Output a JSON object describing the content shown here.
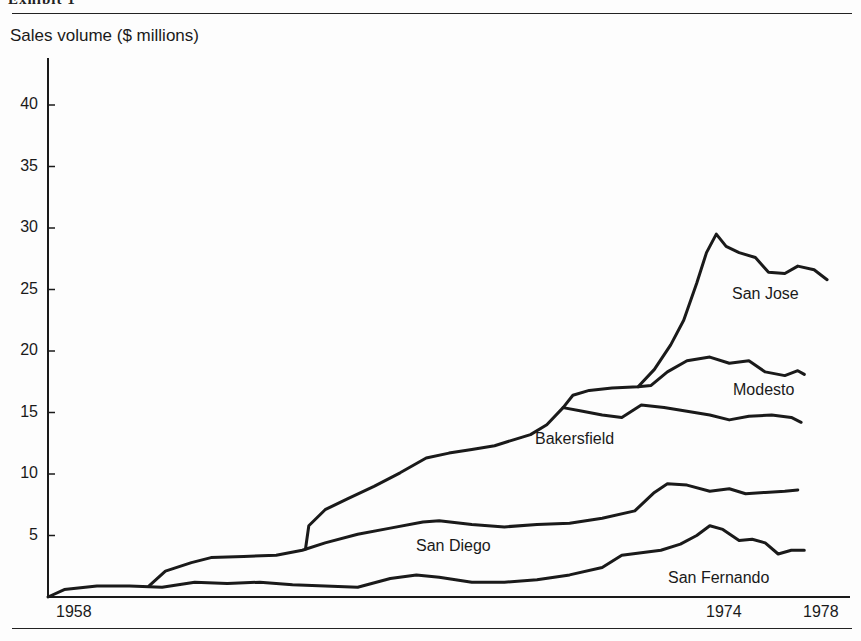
{
  "header": {
    "exhibit_label": "Exhibit 1"
  },
  "chart_data": {
    "type": "line",
    "title": "",
    "ylabel": "Sales volume ($ millions)",
    "xlabel": "",
    "ylim": [
      0,
      43
    ],
    "xlim": [
      1958,
      1978
    ],
    "y_ticks": [
      {
        "value": 40,
        "label": "40"
      },
      {
        "value": 35,
        "label": "35"
      },
      {
        "value": 30,
        "label": "30"
      },
      {
        "value": 25,
        "label": "25"
      },
      {
        "value": 20,
        "label": "20"
      },
      {
        "value": 15,
        "label": "15"
      },
      {
        "value": 10,
        "label": "10"
      },
      {
        "value": 5,
        "label": "5"
      }
    ],
    "x_ticks": [
      {
        "label": "1958",
        "px": 56
      },
      {
        "label": "1974",
        "px": 706
      },
      {
        "label": "1978",
        "px": 803
      }
    ],
    "grid": false,
    "legend": "inline labels",
    "series": [
      {
        "name": "San Fernando",
        "label_px": [
          668,
          569
        ],
        "points": [
          [
            1958,
            0
          ],
          [
            1958.5,
            0.6
          ],
          [
            1959.5,
            0.9
          ],
          [
            1960.5,
            0.9
          ],
          [
            1961.5,
            0.8
          ],
          [
            1962.5,
            1.2
          ],
          [
            1963.5,
            1.1
          ],
          [
            1964.5,
            1.2
          ],
          [
            1965.5,
            1.0
          ],
          [
            1966.5,
            0.9
          ],
          [
            1967.5,
            0.8
          ],
          [
            1968.5,
            1.5
          ],
          [
            1969.3,
            1.8
          ],
          [
            1970,
            1.6
          ],
          [
            1971,
            1.2
          ],
          [
            1972,
            1.2
          ],
          [
            1973,
            1.4
          ],
          [
            1974,
            1.8
          ],
          [
            1975,
            2.4
          ],
          [
            1975.6,
            3.4
          ],
          [
            1976.2,
            3.6
          ],
          [
            1976.8,
            3.8
          ],
          [
            1977.4,
            4.3
          ],
          [
            1977.9,
            5.0
          ],
          [
            1978.3,
            5.8
          ],
          [
            1978.7,
            5.5
          ],
          [
            1979.2,
            4.6
          ],
          [
            1979.6,
            4.7
          ],
          [
            1980,
            4.4
          ],
          [
            1980.4,
            3.5
          ],
          [
            1980.8,
            3.8
          ],
          [
            1981.2,
            3.8
          ]
        ]
      },
      {
        "name": "San Diego",
        "label_px": [
          416,
          537
        ],
        "points": [
          [
            1961.1,
            0.9
          ],
          [
            1961.6,
            2.1
          ],
          [
            1962.4,
            2.8
          ],
          [
            1963,
            3.2
          ],
          [
            1964,
            3.3
          ],
          [
            1965,
            3.4
          ],
          [
            1965.8,
            3.8
          ],
          [
            1966.5,
            4.4
          ],
          [
            1967.5,
            5.1
          ],
          [
            1968.5,
            5.6
          ],
          [
            1969.5,
            6.1
          ],
          [
            1970,
            6.2
          ],
          [
            1971,
            5.9
          ],
          [
            1972,
            5.7
          ],
          [
            1973,
            5.9
          ],
          [
            1974,
            6.0
          ],
          [
            1975,
            6.4
          ],
          [
            1976,
            7.0
          ],
          [
            1976.6,
            8.5
          ],
          [
            1977,
            9.2
          ],
          [
            1977.6,
            9.1
          ],
          [
            1978.3,
            8.6
          ],
          [
            1978.9,
            8.8
          ],
          [
            1979.4,
            8.4
          ],
          [
            1980,
            8.5
          ],
          [
            1980.6,
            8.6
          ],
          [
            1981,
            8.7
          ]
        ]
      },
      {
        "name": "Bakersfield",
        "label_px": [
          535,
          430
        ],
        "points": [
          [
            1965.9,
            3.9
          ],
          [
            1966,
            5.8
          ],
          [
            1966.5,
            7.1
          ],
          [
            1967.2,
            8.0
          ],
          [
            1968,
            9.0
          ],
          [
            1968.8,
            10.1
          ],
          [
            1969.6,
            11.3
          ],
          [
            1970.3,
            11.7
          ],
          [
            1971,
            12.0
          ],
          [
            1971.7,
            12.3
          ],
          [
            1972.3,
            12.8
          ],
          [
            1972.8,
            13.2
          ],
          [
            1973.3,
            14.0
          ],
          [
            1973.8,
            15.4
          ],
          [
            1974.4,
            15.1
          ],
          [
            1975,
            14.8
          ],
          [
            1975.6,
            14.6
          ],
          [
            1976.2,
            15.6
          ],
          [
            1976.9,
            15.4
          ],
          [
            1977.6,
            15.1
          ],
          [
            1978.3,
            14.8
          ],
          [
            1978.9,
            14.4
          ],
          [
            1979.5,
            14.7
          ],
          [
            1980.2,
            14.8
          ],
          [
            1980.8,
            14.6
          ],
          [
            1981.1,
            14.2
          ]
        ]
      },
      {
        "name": "Modesto",
        "label_px": [
          733,
          381
        ],
        "points": [
          [
            1973.8,
            15.4
          ],
          [
            1974.1,
            16.4
          ],
          [
            1974.6,
            16.8
          ],
          [
            1975.3,
            17.0
          ],
          [
            1976.1,
            17.1
          ],
          [
            1976.5,
            17.2
          ],
          [
            1977,
            18.3
          ],
          [
            1977.6,
            19.2
          ],
          [
            1978.3,
            19.5
          ],
          [
            1978.9,
            19.0
          ],
          [
            1979.5,
            19.2
          ],
          [
            1980,
            18.3
          ],
          [
            1980.6,
            18.0
          ],
          [
            1981,
            18.4
          ],
          [
            1981.2,
            18.1
          ]
        ]
      },
      {
        "name": "San Jose",
        "label_px": [
          732,
          285
        ],
        "points": [
          [
            1976.1,
            17.1
          ],
          [
            1976.6,
            18.5
          ],
          [
            1977.1,
            20.5
          ],
          [
            1977.5,
            22.5
          ],
          [
            1977.9,
            25.5
          ],
          [
            1978.2,
            28.0
          ],
          [
            1978.5,
            29.5
          ],
          [
            1978.8,
            28.5
          ],
          [
            1979.2,
            28.0
          ],
          [
            1979.7,
            27.6
          ],
          [
            1980.1,
            26.4
          ],
          [
            1980.6,
            26.3
          ],
          [
            1981,
            26.9
          ],
          [
            1981.5,
            26.6
          ],
          [
            1981.9,
            25.8
          ]
        ]
      }
    ]
  }
}
